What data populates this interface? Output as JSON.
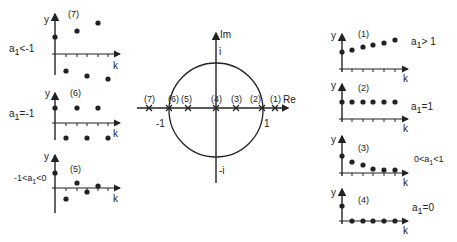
{
  "center": {
    "axis_im": "Im",
    "axis_re": "Re",
    "label_i": "i",
    "label_neg_i": "-i",
    "label_one": "1",
    "label_neg_one": "-1",
    "poles": [
      {
        "id": "(7)",
        "x": -1.55
      },
      {
        "id": "(6)",
        "x": -1.0
      },
      {
        "id": "(5)",
        "x": -0.55
      },
      {
        "id": "(4)",
        "x": 0.0
      },
      {
        "id": "(3)",
        "x": 0.45
      },
      {
        "id": "(2)",
        "x": 1.0
      },
      {
        "id": "(1)",
        "x": 1.27
      }
    ]
  },
  "left_plots": [
    {
      "id": "(7)",
      "condition": "a1<-1",
      "y_label": "y",
      "x_label": "k"
    },
    {
      "id": "(6)",
      "condition": "a1=-1",
      "y_label": "y",
      "x_label": "k"
    },
    {
      "id": "(5)",
      "condition": "-1<a1<0",
      "y_label": "y",
      "x_label": "k"
    }
  ],
  "right_plots": [
    {
      "id": "(1)",
      "condition": "a1>1",
      "y_label": "y",
      "x_label": "k"
    },
    {
      "id": "(2)",
      "condition": "a1=1",
      "y_label": "y",
      "x_label": "k"
    },
    {
      "id": "(3)",
      "condition": "0<a1<1",
      "y_label": "y",
      "x_label": "k"
    },
    {
      "id": "(4)",
      "condition": "a1=0",
      "y_label": "y",
      "x_label": "k"
    }
  ],
  "text": {
    "p7_id": "(7)",
    "p7_cond_a": "a",
    "p7_cond_sub": "1",
    "p7_cond_rest": "<-1",
    "p6_id": "(6)",
    "p6_cond_a": "a",
    "p6_cond_sub": "1",
    "p6_cond_rest": "=-1",
    "p5_id": "(5)",
    "p5_cond_pre": "-1<a",
    "p5_cond_sub": "1",
    "p5_cond_rest": "<0",
    "p1_id": "(1)",
    "p1_cond_a": "a",
    "p1_cond_sub": "1",
    "p1_cond_rest": "> 1",
    "p2_id": "(2)",
    "p2_cond_a": "a",
    "p2_cond_sub": "1",
    "p2_cond_rest": "=1",
    "p3_id": "(3)",
    "p3_cond_pre": "0<a",
    "p3_cond_sub": "1",
    "p3_cond_rest": "<1",
    "p4_id": "(4)",
    "p4_cond_a": "a",
    "p4_cond_sub": "1",
    "p4_cond_rest": "=0",
    "y": "y",
    "k": "k",
    "im": "Im",
    "re": "Re",
    "i": "i",
    "neg_i": "-i",
    "one": "1",
    "neg_one": "-1",
    "pole7": "(7)",
    "pole6": "(6)",
    "pole5": "(5)",
    "pole4": "(4)",
    "pole3": "(3)",
    "pole2": "(2)",
    "pole1": "(1)"
  }
}
